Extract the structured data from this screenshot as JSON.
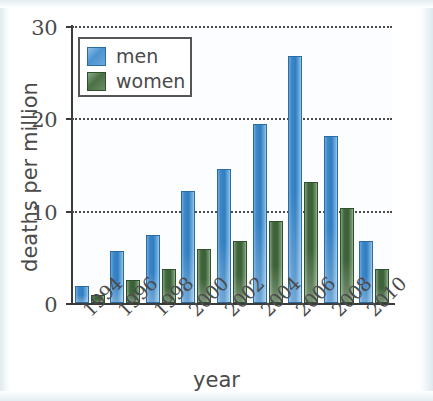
{
  "chart_data": {
    "type": "bar",
    "title": "",
    "xlabel": "year",
    "ylabel": "deaths per million",
    "categories": [
      "1994",
      "1996",
      "1998",
      "2000",
      "2002",
      "2004",
      "2006",
      "2008",
      "2010"
    ],
    "series": [
      {
        "name": "men",
        "color": "#3d86c6",
        "values": [
          1.8,
          5.6,
          7.4,
          12.1,
          14.5,
          19.4,
          26.7,
          18.1,
          6.7
        ]
      },
      {
        "name": "women",
        "color": "#41663c",
        "values": [
          0.9,
          2.5,
          3.7,
          5.9,
          6.7,
          8.9,
          13.1,
          10.3,
          3.7
        ]
      }
    ],
    "ylim": [
      0,
      30
    ],
    "yticks": [
      "0",
      "10",
      "20",
      "30"
    ],
    "ytick_values": [
      0,
      10,
      20,
      30
    ],
    "grid": "horizontal-dotted",
    "legend_position": "top-left",
    "bar_orientation": "vertical",
    "xtick_rotation": "-45"
  },
  "legend": {
    "items": [
      {
        "label": "men",
        "swatch": "blue-swatch-icon"
      },
      {
        "label": "women",
        "swatch": "green-swatch-icon"
      }
    ]
  }
}
